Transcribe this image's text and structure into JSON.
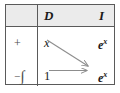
{
  "figure": {
    "name": "tabular-integration-table"
  },
  "table": {
    "columns": [
      {
        "key": "operator",
        "label": ""
      },
      {
        "key": "D",
        "label": "D"
      },
      {
        "key": "I",
        "label": "I"
      }
    ],
    "header": {
      "operator_label": "",
      "d_label": "D",
      "i_label": "I",
      "background": "#ebebeb"
    },
    "rows": [
      {
        "operator": "+",
        "operator_plain": "+",
        "d": "x",
        "i_base": "e",
        "i_exponent": "x",
        "i_plain": "e^x"
      },
      {
        "operator": "-∫",
        "operator_sign": "−",
        "operator_integral": "∫",
        "d": "1",
        "i_base": "e",
        "i_exponent": "x",
        "i_plain": "e^x"
      }
    ],
    "arrows": [
      {
        "name": "diagonal-arrow",
        "from": "row-1-D",
        "to": "row-2-I",
        "style": "diagonal-down-right"
      },
      {
        "name": "horizontal-arrow",
        "from": "row-2-D",
        "to": "row-2-I",
        "style": "horizontal-right"
      }
    ]
  },
  "colors": {
    "border": "#5a5a5a",
    "header_fill": "#ebebeb",
    "text": "#1a1a1a",
    "operator_text": "#4a4a4a",
    "arrow": "#8d8d8d",
    "page_background": "#ffffff"
  }
}
